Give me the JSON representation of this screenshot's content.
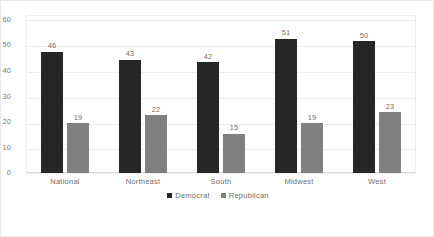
{
  "chart_data": {
    "type": "bar",
    "title": "",
    "subtitle": "",
    "xlabel": "",
    "ylabel": "",
    "ylim": [
      0,
      60
    ],
    "yticks": [
      0,
      10,
      20,
      30,
      40,
      50,
      60
    ],
    "grid": true,
    "legend_position": "bottom",
    "categories": [
      "National",
      "Northeast",
      "South",
      "Midwest",
      "West"
    ],
    "series": [
      {
        "name": "Democrat",
        "color": "#262626",
        "values": [
          46,
          43,
          42,
          51,
          50
        ],
        "labels": [
          "46",
          "43",
          "42",
          "51",
          "50"
        ]
      },
      {
        "name": "Republican",
        "color": "#808080",
        "values": [
          19,
          22,
          15,
          19,
          23
        ],
        "labels": [
          "19",
          "22",
          "15",
          "19",
          "23"
        ]
      }
    ]
  },
  "yaxis": {
    "ticks": [
      "60",
      "50",
      "40",
      "30",
      "20",
      "10",
      "0"
    ]
  },
  "legend": {
    "items": [
      {
        "label": "Democrat",
        "swatch": "dem"
      },
      {
        "label": "Republican",
        "swatch": "rep"
      }
    ]
  }
}
